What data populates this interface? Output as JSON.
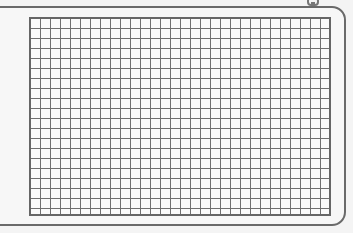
{
  "figure": {
    "grid": {
      "columns": 30,
      "rows": 20
    },
    "icons": [
      "clip-icon"
    ],
    "colors": {
      "background": "#f4f4f4",
      "frame": "#6a6a6a",
      "grid_lines": "#707070",
      "grid_fill": "#fafafa"
    }
  }
}
